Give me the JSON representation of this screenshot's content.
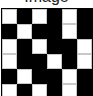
{
  "caption": {
    "text": "Image"
  },
  "board": {
    "rows": 6,
    "cols": 6,
    "colors": {
      "filled": "#000000",
      "empty": "#ffffff",
      "divider": "#c8c8c8"
    },
    "cells": [
      [
        "W",
        "B",
        "W",
        "B",
        "W",
        "B"
      ],
      [
        "B",
        "W",
        "B",
        "B",
        "W",
        "B"
      ],
      [
        "W",
        "B",
        "W",
        "B",
        "B",
        "W"
      ],
      [
        "W",
        "B",
        "B",
        "W",
        "B",
        "W"
      ],
      [
        "B",
        "W",
        "B",
        "B",
        "W",
        "B"
      ],
      [
        "W",
        "B",
        "W",
        "B",
        "W",
        "B"
      ]
    ]
  }
}
